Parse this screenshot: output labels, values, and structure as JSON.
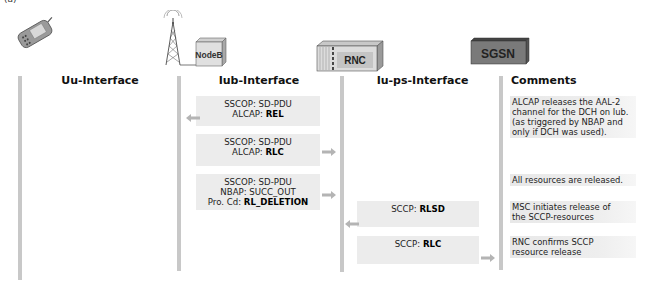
{
  "figure_label": "(a)",
  "entities": [
    {
      "name": "UE",
      "icon": "mobile-phone-icon"
    },
    {
      "name": "NodeB",
      "icon": "nodeb-tower-icon",
      "label": "NodeB"
    },
    {
      "name": "RNC",
      "icon": "rnc-rack-icon",
      "label": "RNC"
    },
    {
      "name": "SGSN",
      "icon": "sgsn-server-icon",
      "label": "SGSN"
    }
  ],
  "columns": {
    "uu": "Uu-Interface",
    "iub": "Iub-Interface",
    "iups": "Iu-ps-Interface",
    "comments": "Comments"
  },
  "messages": [
    {
      "interface": "Iub",
      "direction": "left",
      "lines": [
        {
          "prefix": "SSCOP: ",
          "value": "SD-PDU",
          "bold": false
        },
        {
          "prefix": "ALCAP: ",
          "value": "REL",
          "bold": true
        }
      ]
    },
    {
      "interface": "Iub",
      "direction": "right",
      "lines": [
        {
          "prefix": "SSCOP: ",
          "value": "SD-PDU",
          "bold": false
        },
        {
          "prefix": "ALCAP: ",
          "value": "RLC",
          "bold": true
        }
      ]
    },
    {
      "interface": "Iub",
      "direction": "right",
      "lines": [
        {
          "prefix": "SSCOP: ",
          "value": "SD-PDU",
          "bold": false
        },
        {
          "prefix": "NBAP: ",
          "value": "SUCC_OUT",
          "bold": false
        },
        {
          "prefix": "Pro. Cd: ",
          "value": "RL_DELETION",
          "bold": true
        }
      ]
    },
    {
      "interface": "Iu-ps",
      "direction": "left",
      "lines": [
        {
          "prefix": "SCCP: ",
          "value": "RLSD",
          "bold": true
        }
      ]
    },
    {
      "interface": "Iu-ps",
      "direction": "right",
      "lines": [
        {
          "prefix": "SCCP: ",
          "value": "RLC",
          "bold": true
        }
      ]
    }
  ],
  "comments": [
    {
      "lines": [
        "ALCAP releases the AAL-2",
        "channel for the DCH on Iub.",
        "(as triggered by NBAP and",
        "only if DCH was used)."
      ]
    },
    {
      "lines": [
        "All resources are released."
      ]
    },
    {
      "lines": [
        "MSC initiates release of",
        "the SCCP-resources"
      ]
    },
    {
      "lines": [
        "RNC confirms SCCP",
        "resource release"
      ]
    }
  ],
  "colors": {
    "lifeline": "#c8c8c8",
    "message_bg": "#ececec",
    "arrow": "#b4b4b4",
    "sgsn_box": "#7a7a7a"
  }
}
